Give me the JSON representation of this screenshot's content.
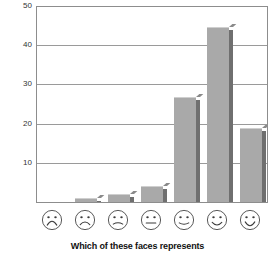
{
  "chart_data": {
    "type": "bar",
    "title": "",
    "subtitle": "",
    "xlabel": "Which of these faces represents",
    "ylabel": "Percent",
    "ylim": [
      0,
      50
    ],
    "yticks": [
      50,
      40,
      30,
      20,
      10
    ],
    "grid": true,
    "legend": false,
    "categories": [
      "very-sad-face",
      "sad-face",
      "slightly-sad-face",
      "neutral-face",
      "slight-smile-face",
      "smile-face",
      "big-smile-face"
    ],
    "category_labels": [
      "☹ very sad",
      "☹ sad",
      "slightly sad",
      "neutral",
      "slightly happy",
      "happy",
      "very happy"
    ],
    "values": [
      0,
      1,
      2,
      4,
      27,
      45,
      19
    ],
    "bar_color": "#a9a9a9",
    "bar_shadow_color": "#6f6f6f",
    "axis_color": "#8d8d8d",
    "gridline_color": "#9a9a9a",
    "background": "#ffffff"
  },
  "axis": {
    "y_title": "Percent",
    "x_title": "Which of these faces represents",
    "tick_labels": [
      "50",
      "40",
      "30",
      "20",
      "10"
    ]
  }
}
